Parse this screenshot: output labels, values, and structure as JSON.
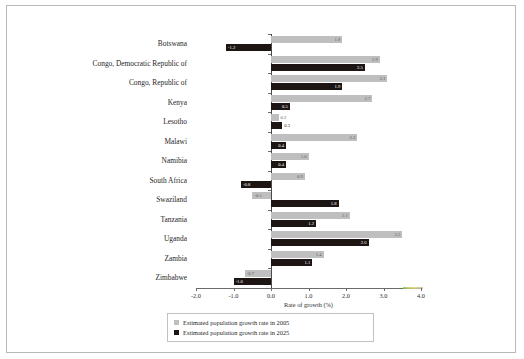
{
  "chart_data": {
    "type": "bar",
    "orientation": "horizontal",
    "title": "",
    "xlabel": "Rate of growth (%)",
    "ylabel": "",
    "xlim": [
      -2.0,
      4.0
    ],
    "xticks": [
      "-2.0",
      "-1.0",
      "0.0",
      "1.0",
      "2.0",
      "3.0",
      "4.0"
    ],
    "xtick_values": [
      -2.0,
      -1.0,
      0.0,
      1.0,
      2.0,
      3.0,
      4.0
    ],
    "grid": false,
    "legend_position": "bottom",
    "categories": [
      "Botswana",
      "Congo, Democratic Republic of",
      "Congo, Republic of",
      "Kenya",
      "Lesotho",
      "Malawi",
      "Namibia",
      "South Africa",
      "Swaziland",
      "Tanzania",
      "Uganda",
      "Zambia",
      "Zimbabwe"
    ],
    "series": [
      {
        "name": "Estimated population growth rate in 2005",
        "color": "#bfbfbf",
        "values": [
          1.9,
          2.9,
          3.1,
          2.7,
          0.2,
          2.3,
          1.0,
          0.9,
          -0.5,
          2.1,
          3.5,
          1.4,
          -0.7
        ],
        "labels": [
          "1.9",
          "2.9",
          "3.1",
          "2.7",
          "0.2",
          "2.3",
          "1.0",
          "0.9",
          "-0.5",
          "2.1",
          "3.5",
          "1.4",
          "-0.7"
        ]
      },
      {
        "name": "Estimated population growth rate in 2025",
        "color": "#1c1513",
        "values": [
          -1.2,
          2.5,
          1.9,
          0.5,
          0.3,
          0.4,
          0.4,
          -0.8,
          1.8,
          1.2,
          2.6,
          1.1,
          -1.0
        ],
        "labels": [
          "-1.2",
          "2.5",
          "1.9",
          "0.5",
          "0.3",
          "0.4",
          "0.4",
          "-0.8",
          "1.8",
          "1.2",
          "2.6",
          "1.1",
          "-1.0"
        ]
      }
    ]
  },
  "legend": {
    "entries": [
      "Estimated population growth rate in 2005",
      "Estimated population growth rate in 2025"
    ]
  }
}
